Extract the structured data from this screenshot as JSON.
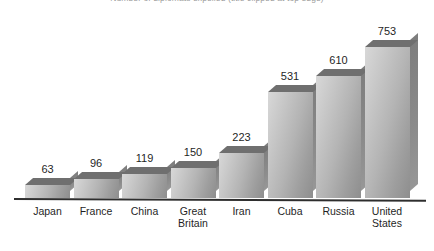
{
  "chart_data": {
    "type": "bar",
    "title": "Number of diplomats expelled (title clipped at top edge)",
    "xlabel": "",
    "ylabel": "",
    "ylim": [
      0,
      800
    ],
    "grid": false,
    "legend": "none",
    "style": "3d-grayscale-column",
    "categories": [
      "Japan",
      "France",
      "China",
      "Great Britain",
      "Iran",
      "Cuba",
      "Russia",
      "United States"
    ],
    "category_lines": [
      [
        "Japan"
      ],
      [
        "France"
      ],
      [
        "China"
      ],
      [
        "Great",
        "Britain"
      ],
      [
        "Iran"
      ],
      [
        "Cuba"
      ],
      [
        "Russia"
      ],
      [
        "United",
        "States"
      ]
    ],
    "values": [
      63,
      96,
      119,
      150,
      223,
      531,
      610,
      753
    ],
    "value_labels": [
      "63",
      "96",
      "119",
      "150",
      "223",
      "531",
      "610",
      "753"
    ]
  },
  "axis": {
    "baseline_visible": true,
    "baseline_color": "#2e2e2e"
  },
  "colors": {
    "background": "#ffffff",
    "bar_front_light": "#d8d8d8",
    "bar_front_dark": "#8e8e8e",
    "bar_side": "#8b8b8b",
    "bar_top": "#6f6f6f",
    "text": "#1f1f1f",
    "axis": "#2e2e2e"
  }
}
